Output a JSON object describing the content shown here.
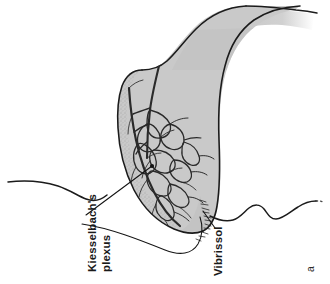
{
  "figure": {
    "panel_letter": "a",
    "background_color": "#ffffff",
    "ink_color": "#1b1b1b",
    "septum_fill_color": "#c9c9c9",
    "septum_fill_color_dark": "#bdbdbd",
    "vessel_color": "#2a2a2a",
    "width": 330,
    "height": 284,
    "rotation_degrees": 90
  },
  "labels": [
    {
      "id": "kiesselbach",
      "name": "kiesselbachs-plexus-label",
      "line1": "Kiesselbach's",
      "line2": "plexus",
      "x": 96,
      "y": 272,
      "rotation": -90
    },
    {
      "id": "vibrissol",
      "name": "vibrissol-label",
      "line1": "Vibrissol",
      "line2": "",
      "x": 222,
      "y": 276,
      "rotation": -90
    }
  ],
  "regions": [
    {
      "name": "nasal-septum-shaded-region",
      "description": "shaded nasal septum"
    },
    {
      "name": "kiesselbach-vascular-network",
      "description": "anastomotic vessel network"
    },
    {
      "name": "vibrissae-hairs",
      "description": "nasal vestibule hairs"
    },
    {
      "name": "facial-profile-contour-left",
      "description": "left facial contour line"
    },
    {
      "name": "facial-profile-contour-right",
      "description": "right facial contour line"
    }
  ]
}
